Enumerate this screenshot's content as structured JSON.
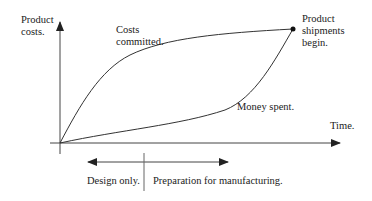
{
  "diagram": {
    "y_axis_label": [
      "Product",
      "costs."
    ],
    "x_axis_label": "Time.",
    "curves": [
      {
        "name": "costs-committed",
        "label": [
          "Costs",
          "committed."
        ]
      },
      {
        "name": "money-spent",
        "label": "Money spent."
      }
    ],
    "endpoint_label": [
      "Product",
      "shipments",
      "begin."
    ],
    "phases": [
      {
        "label": "Design only."
      },
      {
        "label": "Preparation for manufacturing."
      }
    ],
    "colors": {
      "line": "#333333",
      "background": "#ffffff"
    }
  }
}
